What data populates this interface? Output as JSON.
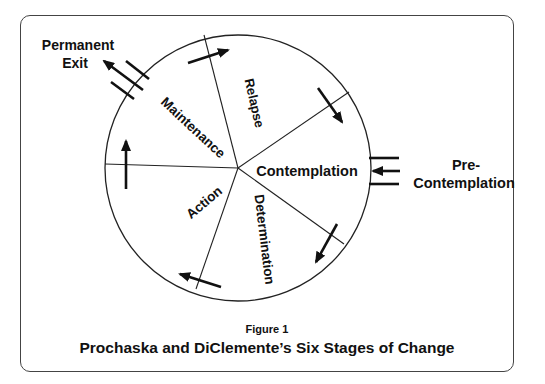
{
  "diagram": {
    "type": "cycle-wheel",
    "stages": [
      {
        "name": "Relapse",
        "label": "Relapse"
      },
      {
        "name": "Contemplation",
        "label": "Contemplation"
      },
      {
        "name": "Determination",
        "label": "Determination"
      },
      {
        "name": "Action",
        "label": "Action"
      },
      {
        "name": "Maintenance",
        "label": "Maintenance"
      }
    ],
    "external": {
      "entry": {
        "line1": "Pre-",
        "line2": "Contemplation"
      },
      "exit": {
        "line1": "Permanent",
        "line2": "Exit"
      }
    },
    "direction": "clockwise"
  },
  "caption": {
    "figure_label": "Figure 1",
    "title": "Prochaska and DiClemente’s Six Stages of Change"
  }
}
